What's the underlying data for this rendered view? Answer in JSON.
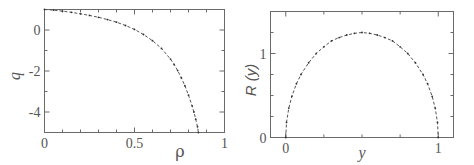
{
  "chart_data": [
    {
      "type": "line",
      "title": "",
      "xlabel": "ρ",
      "ylabel": "q",
      "xlim": [
        0,
        1
      ],
      "ylim": [
        -5,
        1
      ],
      "xticks": [
        0,
        0.5,
        1
      ],
      "xtick_labels": [
        "0",
        "0.5",
        "1"
      ],
      "yticks": [
        0,
        -2,
        -4
      ],
      "ytick_labels": [
        "0",
        "-2",
        "-4"
      ],
      "grid": false,
      "series": [
        {
          "name": "q(ρ)",
          "style": "dashed line with dot markers",
          "x": [
            0,
            0.05,
            0.1,
            0.15,
            0.2,
            0.25,
            0.3,
            0.35,
            0.4,
            0.45,
            0.5,
            0.55,
            0.6,
            0.65,
            0.7,
            0.72,
            0.74,
            0.76,
            0.78,
            0.8,
            0.82,
            0.83,
            0.84,
            0.85,
            0.855
          ],
          "y": [
            1,
            0.97,
            0.92,
            0.86,
            0.79,
            0.71,
            0.62,
            0.51,
            0.38,
            0.22,
            0.03,
            -0.22,
            -0.52,
            -0.9,
            -1.42,
            -1.68,
            -1.98,
            -2.33,
            -2.72,
            -3.18,
            -3.7,
            -4.0,
            -4.35,
            -4.72,
            -5.0
          ]
        }
      ]
    },
    {
      "type": "line",
      "title": "",
      "xlabel": "y",
      "ylabel": "R (y)",
      "xlim": [
        -0.1,
        1.1
      ],
      "ylim": [
        0,
        1.5
      ],
      "xticks": [
        0,
        1
      ],
      "xtick_labels": [
        "0",
        "1"
      ],
      "yticks": [
        0,
        1
      ],
      "ytick_labels": [
        "0",
        "1"
      ],
      "grid": false,
      "series": [
        {
          "name": "R(y)",
          "style": "dashed line with dot markers",
          "x": [
            0,
            0.005,
            0.02,
            0.04,
            0.07,
            0.1,
            0.15,
            0.2,
            0.25,
            0.3,
            0.35,
            0.4,
            0.45,
            0.5,
            0.55,
            0.6,
            0.65,
            0.7,
            0.75,
            0.8,
            0.85,
            0.9,
            0.93,
            0.96,
            0.98,
            0.995,
            1
          ],
          "y": [
            0,
            0.18,
            0.35,
            0.49,
            0.64,
            0.75,
            0.89,
            1.0,
            1.08,
            1.15,
            1.19,
            1.22,
            1.24,
            1.25,
            1.24,
            1.22,
            1.19,
            1.15,
            1.08,
            1.0,
            0.89,
            0.75,
            0.64,
            0.49,
            0.35,
            0.18,
            0
          ]
        }
      ]
    }
  ]
}
